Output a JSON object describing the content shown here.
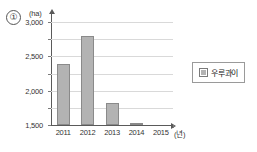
{
  "figure": {
    "marker_label": "①",
    "y_unit": "(ha)",
    "x_unit": "(년)"
  },
  "legend": {
    "position": "right",
    "swatch_icon": "filled-square-icon",
    "entries": [
      {
        "label": "우루과이",
        "color": "#b3b3b3"
      }
    ]
  },
  "chart_data": {
    "type": "bar",
    "title": "",
    "xlabel": "(년)",
    "ylabel": "(ha)",
    "categories": [
      "2011",
      "2012",
      "2013",
      "2014",
      "2015"
    ],
    "values": [
      1790,
      2580,
      650,
      30,
      0
    ],
    "series": [
      {
        "name": "우루과이",
        "values": [
          1790,
          2580,
          650,
          30,
          0
        ]
      }
    ],
    "ylim": [
      0,
      3000
    ],
    "yticks": [
      0,
      500,
      1000,
      1500,
      2000,
      2500,
      3000
    ],
    "ytick_labels": [
      "0",
      "500",
      "1,000",
      "1,500",
      "2,000",
      "2,500",
      "3,000"
    ],
    "grid": true,
    "legend_position": "right",
    "bar_color": "#b3b3b3",
    "bar_border_color": "#8a8a8a",
    "grid_color": "#d9d9d9",
    "axis_color": "#5a5a5a"
  }
}
